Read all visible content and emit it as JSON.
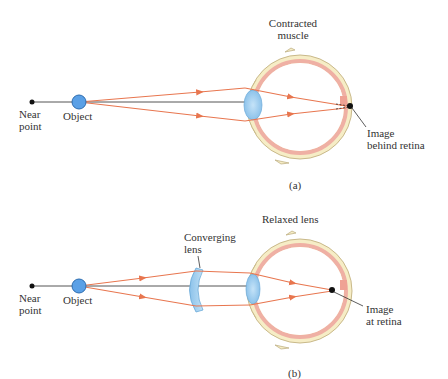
{
  "colors": {
    "ray": "#e8764f",
    "axis": "#555555",
    "object_fill": "#5aa0e6",
    "object_stroke": "#2d6db0",
    "sclera": "#f6edc6",
    "sclera_stroke": "#c9b98a",
    "choroid": "#efb0a4",
    "lens_fill": "#a9d3f2",
    "point": "#111111",
    "text": "#333333"
  },
  "panel_a": {
    "near_point_label": "Near\npoint",
    "object_label": "Object",
    "muscle_label": "Contracted\nmuscle",
    "image_label": "Image\nbehind retina",
    "caption": "(a)"
  },
  "panel_b": {
    "near_point_label": "Near\npoint",
    "object_label": "Object",
    "converging_lens_label": "Converging\nlens",
    "relaxed_lens_label": "Relaxed lens",
    "image_label": "Image\nat retina",
    "caption": "(b)"
  }
}
